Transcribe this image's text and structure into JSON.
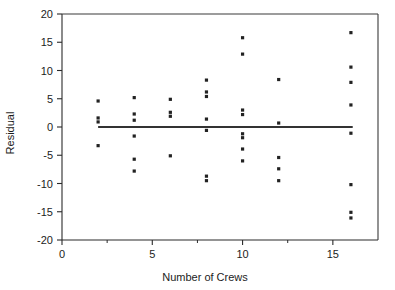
{
  "chart_data": {
    "type": "scatter",
    "title": "",
    "xlabel": "Number of Crews",
    "ylabel": "Residual",
    "xlim": [
      0,
      17.5
    ],
    "ylim": [
      -20,
      20
    ],
    "grid": false,
    "legend": null,
    "x_ticks": [
      0,
      5,
      10,
      15
    ],
    "x_tick_labels": [
      "0",
      "5",
      "10",
      "15"
    ],
    "x_minor_ticks": [
      2.5,
      7.5,
      12.5
    ],
    "y_ticks": [
      20,
      15,
      10,
      5,
      0,
      -5,
      -10,
      -15,
      -20
    ],
    "y_tick_labels": [
      "20",
      "15",
      "10",
      "5",
      "0",
      "-5",
      "-10",
      "-15",
      "-20"
    ],
    "reference_line": {
      "label": "zero-residual-line",
      "y": 0,
      "x_start": 2,
      "x_end": 16.1
    },
    "points": [
      {
        "x": 2,
        "y": 4.6
      },
      {
        "x": 2,
        "y": 1.6
      },
      {
        "x": 2,
        "y": 0.9
      },
      {
        "x": 2,
        "y": -3.3
      },
      {
        "x": 4,
        "y": 5.2
      },
      {
        "x": 4,
        "y": 2.3
      },
      {
        "x": 4,
        "y": 1.2
      },
      {
        "x": 4,
        "y": -1.6
      },
      {
        "x": 4,
        "y": -5.7
      },
      {
        "x": 4,
        "y": -7.8
      },
      {
        "x": 6,
        "y": 4.9
      },
      {
        "x": 6,
        "y": 2.6
      },
      {
        "x": 6,
        "y": 1.9
      },
      {
        "x": 6,
        "y": -5.1
      },
      {
        "x": 8,
        "y": 8.3
      },
      {
        "x": 8,
        "y": 6.2
      },
      {
        "x": 8,
        "y": 5.4
      },
      {
        "x": 8,
        "y": 1.4
      },
      {
        "x": 8,
        "y": -0.6
      },
      {
        "x": 8,
        "y": -8.7
      },
      {
        "x": 8,
        "y": -9.5
      },
      {
        "x": 10,
        "y": 15.8
      },
      {
        "x": 10,
        "y": 12.9
      },
      {
        "x": 10,
        "y": 3.0
      },
      {
        "x": 10,
        "y": 2.2
      },
      {
        "x": 10,
        "y": -1.2
      },
      {
        "x": 10,
        "y": -1.9
      },
      {
        "x": 10,
        "y": -3.9
      },
      {
        "x": 10,
        "y": -6.0
      },
      {
        "x": 12,
        "y": 8.4
      },
      {
        "x": 12,
        "y": 0.7
      },
      {
        "x": 12,
        "y": -5.4
      },
      {
        "x": 12,
        "y": -7.4
      },
      {
        "x": 12,
        "y": -9.5
      },
      {
        "x": 16,
        "y": 16.7
      },
      {
        "x": 16,
        "y": 10.6
      },
      {
        "x": 16,
        "y": 7.9
      },
      {
        "x": 16,
        "y": 3.9
      },
      {
        "x": 16,
        "y": -1.1
      },
      {
        "x": 16,
        "y": -10.2
      },
      {
        "x": 16,
        "y": -15.1
      },
      {
        "x": 16,
        "y": -16.1
      }
    ]
  },
  "figure": {
    "partial_top_title": ""
  }
}
